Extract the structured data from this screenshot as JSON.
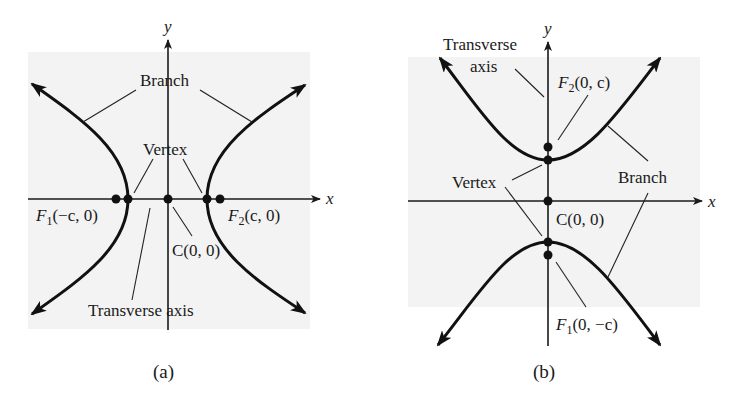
{
  "figure": {
    "panels": [
      {
        "id": "a",
        "caption": "(a)",
        "orientation": "horizontal transverse axis",
        "axes": {
          "x_label": "x",
          "y_label": "y"
        },
        "labels": {
          "branch": "Branch",
          "vertex": "Vertex",
          "focus1_name": "F",
          "focus1_sub": "1",
          "focus1_coord": "(−c, 0)",
          "focus2_name": "F",
          "focus2_sub": "2",
          "focus2_coord": "(c, 0)",
          "center": "C(0, 0)",
          "transverse_axis": "Transverse axis"
        }
      },
      {
        "id": "b",
        "caption": "(b)",
        "orientation": "vertical transverse axis",
        "axes": {
          "x_label": "x",
          "y_label": "y"
        },
        "labels": {
          "transverse_axis_line1": "Transverse",
          "transverse_axis_line2": "axis",
          "focus2_name": "F",
          "focus2_sub": "2",
          "focus2_coord": "(0, c)",
          "vertex": "Vertex",
          "branch": "Branch",
          "center": "C(0, 0)",
          "focus1_name": "F",
          "focus1_sub": "1",
          "focus1_coord": "(0, −c)"
        }
      }
    ]
  }
}
